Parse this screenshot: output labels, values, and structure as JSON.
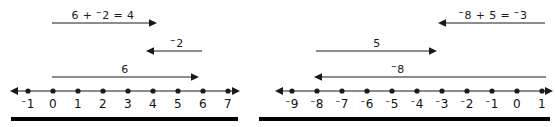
{
  "figure": {
    "stroke_color": "#1a1a1a",
    "rule_color": "#000000"
  },
  "panels": [
    {
      "id": "left",
      "equation_label": "6 + ⁻2 = 4",
      "arrows": [
        {
          "name": "sum-arrow",
          "label": "6 + ⁻2 = 4",
          "label_text_parts": [
            "6 + ",
            "⁻",
            "2 = 4"
          ],
          "direction": "right",
          "from_value": -1,
          "to_value": 3,
          "length_units": 4
        },
        {
          "name": "negative-two-arrow",
          "label": "⁻2",
          "direction": "left",
          "from_value": 6,
          "to_value": 4,
          "length_units": 2
        },
        {
          "name": "six-arrow",
          "label": "6",
          "direction": "right",
          "from_value": -1,
          "to_value": 5,
          "length_units": 6
        }
      ],
      "number_line": {
        "name": "number-line-left",
        "ticks": [
          "⁻1",
          "0",
          "1",
          "2",
          "3",
          "4",
          "5",
          "6",
          "7"
        ],
        "tick_values": [
          -1,
          0,
          1,
          2,
          3,
          4,
          5,
          6,
          7
        ],
        "min": -1,
        "max": 7,
        "arrowheads": "both"
      }
    },
    {
      "id": "right",
      "equation_label": "⁻8 + 5 = ⁻3",
      "arrows": [
        {
          "name": "sum-arrow",
          "label": "⁻8 + 5 = ⁻3",
          "direction": "left",
          "from_value": 1,
          "to_value": -3,
          "length_units": 4
        },
        {
          "name": "five-arrow",
          "label": "5",
          "direction": "right",
          "from_value": -8,
          "to_value": -3,
          "length_units": 5
        },
        {
          "name": "negative-eight-arrow",
          "label": "⁻8",
          "direction": "left",
          "from_value": 1,
          "to_value": -7,
          "length_units": 8
        }
      ],
      "number_line": {
        "name": "number-line-right",
        "ticks": [
          "⁻9",
          "⁻8",
          "⁻7",
          "⁻6",
          "⁻5",
          "⁻4",
          "⁻3",
          "⁻2",
          "⁻1",
          "0",
          "1"
        ],
        "tick_values": [
          -9,
          -8,
          -7,
          -6,
          -5,
          -4,
          -3,
          -2,
          -1,
          0,
          1
        ],
        "min": -9,
        "max": 1,
        "arrowheads": "both"
      }
    }
  ]
}
